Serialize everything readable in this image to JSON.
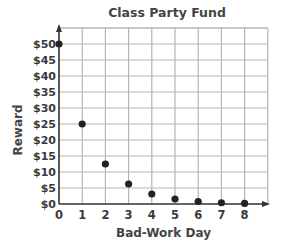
{
  "chart_data": {
    "type": "scatter",
    "title": "Class Party Fund",
    "xlabel": "Bad-Work Day",
    "ylabel": "Reward",
    "x": [
      0,
      1,
      2,
      3,
      4,
      5,
      6,
      7,
      8
    ],
    "values": [
      50,
      25,
      12.5,
      6.25,
      3.125,
      1.5625,
      0.78125,
      0.390625,
      0.1953125
    ],
    "x_ticks": [
      "0",
      "1",
      "2",
      "3",
      "4",
      "5",
      "6",
      "7",
      "8"
    ],
    "y_ticks": [
      "$0",
      "$5",
      "$10",
      "$15",
      "$20",
      "$25",
      "$30",
      "$35",
      "$40",
      "$45",
      "$50"
    ],
    "xlim": [
      0,
      9
    ],
    "ylim": [
      0,
      52.5
    ],
    "grid": true,
    "legend": null
  },
  "colors": {
    "grid": "#b5b5b5",
    "axis": "#333333",
    "point": "#222222"
  }
}
